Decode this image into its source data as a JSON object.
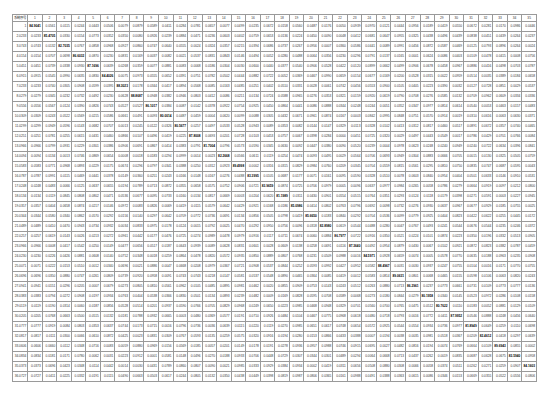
{
  "table": {
    "corner_label": "系统序号",
    "columns": [
      "1",
      "2",
      "3",
      "4",
      "5",
      "6",
      "7",
      "8",
      "9",
      "10",
      "11",
      "12",
      "13",
      "14",
      "15",
      "16",
      "17",
      "18",
      "19",
      "20",
      "21",
      "22",
      "23",
      "24",
      "25",
      "26",
      "27",
      "28",
      "29",
      "30",
      "31",
      "32",
      "33",
      "34",
      "35"
    ],
    "row_count": 36,
    "diagonal_example": "85.2891",
    "rows": []
  }
}
